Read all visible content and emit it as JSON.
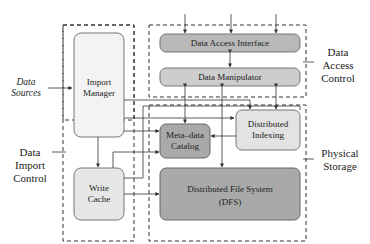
{
  "diagram": {
    "groups": {
      "data_import_control": "Data Import Control",
      "data_access_control": "Data Access Control",
      "physical_storage": "Physical Storage"
    },
    "external": {
      "data_sources": "Data Sources"
    },
    "nodes": {
      "import_manager": "Import Manager",
      "write_cache": "Write Cache",
      "data_access_interface": "Data Access Interface",
      "data_manipulator": "Data Manipulator",
      "metadata_catalog": "Meta–data Catalog",
      "distributed_indexing": "Distributed Indexing",
      "dfs_line1": "Distributed File System",
      "dfs_line2": "(DFS)"
    },
    "colors": {
      "light_box": "#f0f0f0",
      "mid_box": "#c8c8c8",
      "dark_box": "#a8a8a8",
      "line": "#333333"
    }
  }
}
